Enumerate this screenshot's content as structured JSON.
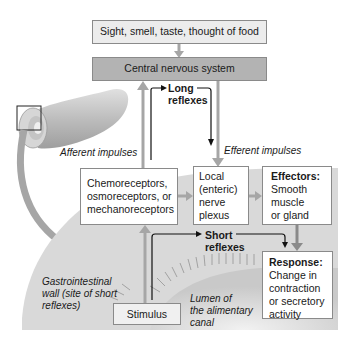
{
  "diagram": {
    "top_box": {
      "label": "Sight, smell, taste, thought of food"
    },
    "cns_box": {
      "label": "Central nervous system"
    },
    "long_reflexes": {
      "line1": "Long",
      "line2": "reflexes"
    },
    "short_reflexes": {
      "line1": "Short",
      "line2": "reflexes"
    },
    "afferent_label": "Afferent impulses",
    "efferent_label": "Efferent impulses",
    "receptors_box": {
      "line1": "Chemoreceptors,",
      "line2": "osmoreceptors, or",
      "line3": "mechanoreceptors"
    },
    "plexus_box": {
      "line1": "Local",
      "line2": "(enteric)",
      "line3": "nerve",
      "line4": "plexus"
    },
    "effectors_box": {
      "title": "Effectors:",
      "line1": "Smooth",
      "line2": "muscle",
      "line3": "or gland"
    },
    "response_box": {
      "title": "Response:",
      "line1": "Change in",
      "line2": "contraction",
      "line3": "or secretory",
      "line4": "activity"
    },
    "stimulus_box": {
      "label": "Stimulus"
    },
    "gi_wall_label": {
      "line1": "Gastrointestinal",
      "line2": "wall (site of short",
      "line3": "reflexes)"
    },
    "lumen_label": {
      "line1": "Lumen of",
      "line2": "the alimentary",
      "line3": "canal"
    }
  },
  "colors": {
    "gray_arrow": "#a6a6a6",
    "cns_fill": "#b3b3b3",
    "top_fill": "#ececec",
    "wall_fill": "#d9d9d9",
    "lumen_fill": "#e6e6e6"
  }
}
